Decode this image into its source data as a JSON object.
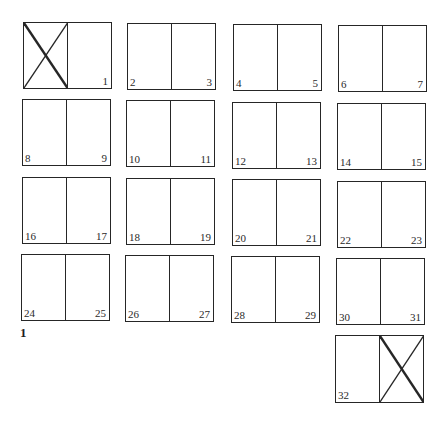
{
  "figure": {
    "label": "1"
  },
  "spreads": [
    {
      "left": "",
      "right": "1",
      "left_blank": true,
      "right_blank": false
    },
    {
      "left": "2",
      "right": "3",
      "left_blank": false,
      "right_blank": false
    },
    {
      "left": "4",
      "right": "5",
      "left_blank": false,
      "right_blank": false
    },
    {
      "left": "6",
      "right": "7",
      "left_blank": false,
      "right_blank": false
    },
    {
      "left": "8",
      "right": "9",
      "left_blank": false,
      "right_blank": false
    },
    {
      "left": "10",
      "right": "11",
      "left_blank": false,
      "right_blank": false
    },
    {
      "left": "12",
      "right": "13",
      "left_blank": false,
      "right_blank": false
    },
    {
      "left": "14",
      "right": "15",
      "left_blank": false,
      "right_blank": false
    },
    {
      "left": "16",
      "right": "17",
      "left_blank": false,
      "right_blank": false
    },
    {
      "left": "18",
      "right": "19",
      "left_blank": false,
      "right_blank": false
    },
    {
      "left": "20",
      "right": "21",
      "left_blank": false,
      "right_blank": false
    },
    {
      "left": "22",
      "right": "23",
      "left_blank": false,
      "right_blank": false
    },
    {
      "left": "24",
      "right": "25",
      "left_blank": false,
      "right_blank": false
    },
    {
      "left": "26",
      "right": "27",
      "left_blank": false,
      "right_blank": false
    },
    {
      "left": "28",
      "right": "29",
      "left_blank": false,
      "right_blank": false
    },
    {
      "left": "30",
      "right": "31",
      "left_blank": false,
      "right_blank": false
    },
    {
      "left": "32",
      "right": "",
      "left_blank": false,
      "right_blank": true
    }
  ],
  "colors": {
    "line": "#262626",
    "text": "#2a2a2a",
    "background": "#ffffff"
  }
}
